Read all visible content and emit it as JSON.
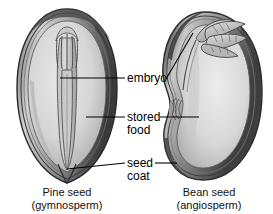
{
  "figure": {
    "type": "labeled-biological-diagram",
    "style": "grayscale halftone textbook illustration",
    "background_color": "#ffffff"
  },
  "labels": [
    {
      "id": "embryo",
      "text": "embryo",
      "line2": ""
    },
    {
      "id": "stored-food",
      "text": "stored",
      "line2": "food"
    },
    {
      "id": "seed-coat",
      "text": "seed",
      "line2": "coat"
    }
  ],
  "captions": {
    "pine": {
      "line1": "Pine seed",
      "line2": "(gymnosperm)"
    },
    "bean": {
      "line1": "Bean seed",
      "line2": "(angiosperm)"
    }
  },
  "colors": {
    "outline": "#2b2b2b",
    "coat_dark": "#3c3c3c",
    "coat_mid": "#7a7a7a",
    "flesh_light": "#dcdcdc",
    "flesh_mid": "#c4c4c4",
    "flesh_shadow": "#9a9a9a",
    "embryo_fill": "#cfcfcf",
    "leader_line": "#000000",
    "text": "#111111"
  },
  "specimens": [
    {
      "id": "pine-seed",
      "name": "Pine seed",
      "group": "gymnosperm",
      "orientation": "vertical oval, pointed at base",
      "parts": [
        "seed coat",
        "stored food",
        "embryo"
      ],
      "embryo_shape": "fork-like cotyledons with elongated radicle"
    },
    {
      "id": "bean-seed",
      "name": "Bean seed",
      "group": "angiosperm",
      "orientation": "kidney shape with hilum notch on left",
      "parts": [
        "seed coat",
        "stored food",
        "embryo"
      ],
      "embryo_shape": "leafy plumule with folded young leaves at top"
    }
  ]
}
